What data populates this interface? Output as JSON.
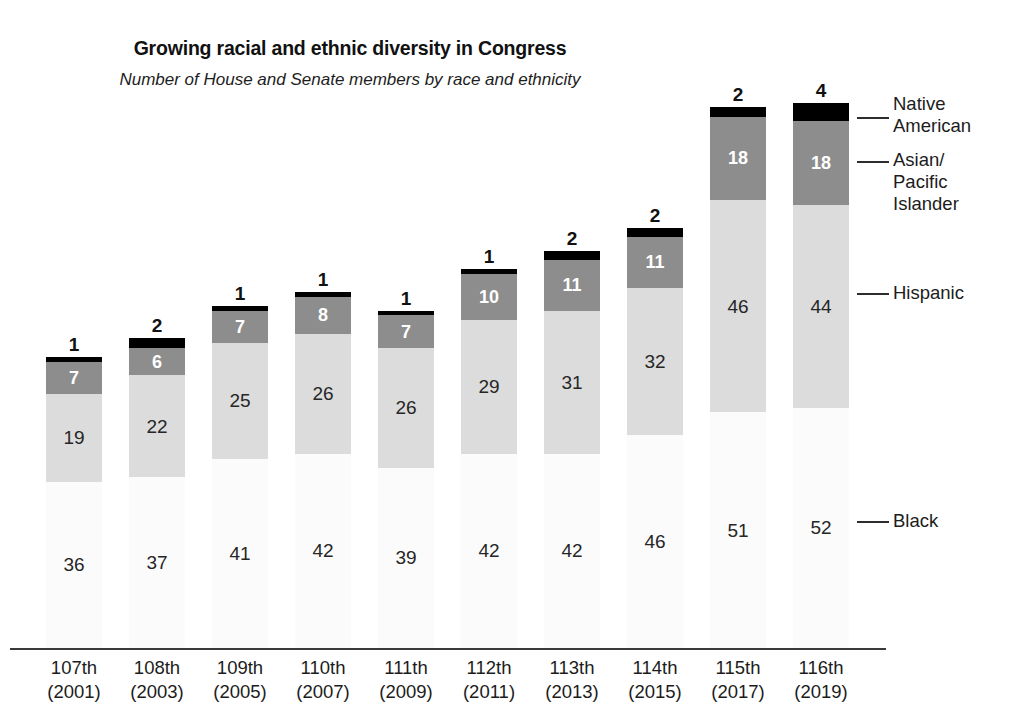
{
  "chart_data": {
    "type": "bar",
    "subtype": "stacked-vertical",
    "title": "Growing racial and ethnic diversity in Congress",
    "subtitle": "Number of House and Senate members by race and ethnicity",
    "xlabel": "",
    "ylabel": "",
    "grid": false,
    "legend_position": "right-leader-lines",
    "categories": [
      "107th\n(2001)",
      "108th\n(2003)",
      "109th\n(2005)",
      "110th\n(2007)",
      "111th\n(2009)",
      "112th\n(2011)",
      "113th\n(2013)",
      "114th\n(2015)",
      "115th\n(2017)",
      "116th\n(2019)"
    ],
    "series": [
      {
        "name": "Black",
        "color": "#fbfbfb",
        "values": [
          36,
          37,
          41,
          42,
          39,
          42,
          42,
          46,
          51,
          52
        ]
      },
      {
        "name": "Hispanic",
        "color": "#dcdcdc",
        "values": [
          19,
          22,
          25,
          26,
          26,
          29,
          31,
          32,
          46,
          44
        ]
      },
      {
        "name": "Asian/Pacific Islander",
        "color": "#8d8d8d",
        "values": [
          7,
          6,
          7,
          8,
          7,
          10,
          11,
          11,
          18,
          18
        ]
      },
      {
        "name": "Native American",
        "color": "#000000",
        "values": [
          1,
          2,
          1,
          1,
          1,
          1,
          2,
          2,
          2,
          4
        ]
      }
    ],
    "totals": [
      63,
      67,
      74,
      77,
      73,
      82,
      86,
      91,
      117,
      118
    ],
    "ylim": [
      0,
      118
    ]
  },
  "x_axis": {
    "ticks": [
      {
        "ordinal": "107th",
        "year": "(2001)"
      },
      {
        "ordinal": "108th",
        "year": "(2003)"
      },
      {
        "ordinal": "109th",
        "year": "(2005)"
      },
      {
        "ordinal": "110th",
        "year": "(2007)"
      },
      {
        "ordinal": "111th",
        "year": "(2009)"
      },
      {
        "ordinal": "112th",
        "year": "(2011)"
      },
      {
        "ordinal": "113th",
        "year": "(2013)"
      },
      {
        "ordinal": "114th",
        "year": "(2015)"
      },
      {
        "ordinal": "115th",
        "year": "(2017)"
      },
      {
        "ordinal": "116th",
        "year": "(2019)"
      }
    ]
  },
  "legend": {
    "items": [
      {
        "label": "Native\nAmerican"
      },
      {
        "label": "Asian/\nPacific\nIslander"
      },
      {
        "label": "Hispanic"
      },
      {
        "label": "Black"
      }
    ]
  },
  "bars": [
    {
      "name": "107th",
      "black": "36",
      "hispanic": "19",
      "asian": "7",
      "native": "1"
    },
    {
      "name": "108th",
      "black": "37",
      "hispanic": "22",
      "asian": "6",
      "native": "2"
    },
    {
      "name": "109th",
      "black": "41",
      "hispanic": "25",
      "asian": "7",
      "native": "1"
    },
    {
      "name": "110th",
      "black": "42",
      "hispanic": "26",
      "asian": "8",
      "native": "1"
    },
    {
      "name": "111th",
      "black": "39",
      "hispanic": "26",
      "asian": "7",
      "native": "1"
    },
    {
      "name": "112th",
      "black": "42",
      "hispanic": "29",
      "asian": "10",
      "native": "1"
    },
    {
      "name": "113th",
      "black": "42",
      "hispanic": "31",
      "asian": "11",
      "native": "2"
    },
    {
      "name": "114th",
      "black": "46",
      "hispanic": "32",
      "asian": "11",
      "native": "2"
    },
    {
      "name": "115th",
      "black": "51",
      "hispanic": "46",
      "asian": "18",
      "native": "2"
    },
    {
      "name": "116th",
      "black": "52",
      "hispanic": "44",
      "asian": "18",
      "native": "4"
    }
  ]
}
